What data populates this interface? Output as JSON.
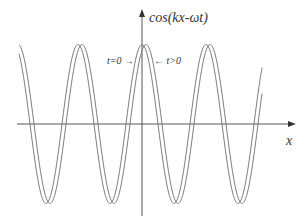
{
  "diagram": {
    "y_axis_label": "cos(kx-ωt)",
    "x_axis_label": "x",
    "annotations": [
      {
        "text": "t=0 →",
        "refers_to": "t0"
      },
      {
        "text": "← t>0",
        "refers_to": "t1"
      }
    ],
    "curves": [
      {
        "id": "t0",
        "name": "t=0",
        "phase_shift_periods": 0.0,
        "color": "#7a7a7a"
      },
      {
        "id": "t1",
        "name": "t>0",
        "phase_shift_periods": 0.0625,
        "color": "#7a7a7a"
      }
    ],
    "wave": {
      "function": "cos",
      "periods_visible_approx": 3.75,
      "amplitude_units": 1
    }
  }
}
